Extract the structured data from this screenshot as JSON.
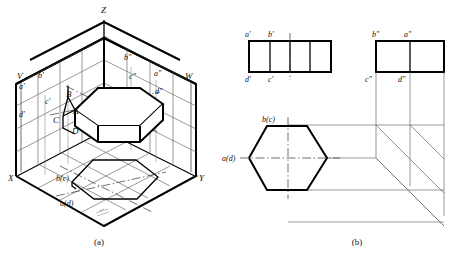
{
  "figure": {
    "captions": {
      "left": "(a)",
      "right": "(b)"
    }
  },
  "axonometric": {
    "name": "three-projection-plane-pictorial",
    "axes": [
      {
        "id": "z-axis-label",
        "label": "Z",
        "x": 101,
        "y": 13
      },
      {
        "id": "x-axis-label",
        "label": "X",
        "x": 10,
        "y": 180
      },
      {
        "id": "y-axis-label",
        "label": "Y",
        "x": 201,
        "y": 180
      }
    ],
    "planes": [
      {
        "id": "v-plane-label",
        "label": "V",
        "x": 18,
        "y": 76
      },
      {
        "id": "w-plane-label",
        "label": "W",
        "x": 186,
        "y": 76
      }
    ],
    "space_points": [
      {
        "id": "point-a",
        "label": "A",
        "x": 72,
        "y": 112
      },
      {
        "id": "point-b",
        "label": "B",
        "x": 68,
        "y": 94
      },
      {
        "id": "point-c",
        "label": "C",
        "x": 55,
        "y": 120
      },
      {
        "id": "point-d",
        "label": "D",
        "x": 74,
        "y": 130
      }
    ],
    "v_projections": [
      {
        "id": "a-prime",
        "label": "a'",
        "x": 21,
        "y": 87
      },
      {
        "id": "b-prime",
        "label": "b'",
        "x": 40,
        "y": 76
      },
      {
        "id": "c-prime",
        "label": "c'",
        "x": 46,
        "y": 102
      },
      {
        "id": "d-prime",
        "label": "d'",
        "x": 21,
        "y": 115
      }
    ],
    "w_projections": [
      {
        "id": "b-double-prime",
        "label": "b\"",
        "x": 126,
        "y": 58
      },
      {
        "id": "a-double-prime",
        "label": "a\"",
        "x": 156,
        "y": 74
      },
      {
        "id": "c-double-prime",
        "label": "c\"",
        "x": 131,
        "y": 77
      },
      {
        "id": "d-double-prime",
        "label": "d\"",
        "x": 157,
        "y": 92
      }
    ],
    "h_projections": [
      {
        "id": "bc-top",
        "label": "b(c)",
        "x": 60,
        "y": 178
      },
      {
        "id": "ad-top",
        "label": "a(d)",
        "x": 64,
        "y": 203
      }
    ]
  },
  "orthographic": {
    "front_view": {
      "name": "front-view-v",
      "labels": [
        {
          "id": "a-prime-fv",
          "label": "a'",
          "x": 246,
          "y": 36
        },
        {
          "id": "b-prime-fv",
          "label": "b'",
          "x": 270,
          "y": 36
        },
        {
          "id": "d-prime-fv",
          "label": "d'",
          "x": 246,
          "y": 76
        },
        {
          "id": "c-prime-fv",
          "label": "c'",
          "x": 270,
          "y": 76
        }
      ],
      "cells": 4
    },
    "side_view": {
      "name": "side-view-w",
      "labels": [
        {
          "id": "b-double-prime-sv",
          "label": "b\"",
          "x": 372,
          "y": 34
        },
        {
          "id": "a-double-prime-sv",
          "label": "a\"",
          "x": 403,
          "y": 34
        },
        {
          "id": "c-double-prime-sv",
          "label": "c\"",
          "x": 365,
          "y": 78
        },
        {
          "id": "d-double-prime-sv",
          "label": "d\"",
          "x": 397,
          "y": 78
        }
      ],
      "cells": 2
    },
    "top_view": {
      "name": "top-view-h",
      "labels": [
        {
          "id": "bc-tv",
          "label": "b(c)",
          "x": 266,
          "y": 119
        },
        {
          "id": "ad-tv",
          "label": "a(d)",
          "x": 226,
          "y": 161
        }
      ],
      "shape": "hexagon"
    }
  },
  "colors": {
    "ink": "#000000",
    "thin_line": "#555555",
    "background": "#ffffff"
  }
}
